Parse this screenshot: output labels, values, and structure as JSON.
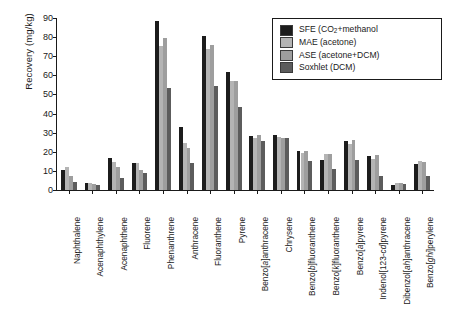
{
  "chart_data": {
    "type": "bar",
    "title": "",
    "xlabel": "",
    "ylabel": "Recovery (mg/kg)",
    "ylim": [
      0,
      90
    ],
    "yticks": [
      0,
      10,
      20,
      30,
      40,
      50,
      60,
      70,
      80,
      90
    ],
    "grid": false,
    "legend_position": "top-right",
    "categories": [
      "Naphthalene",
      "Acenaphthylene",
      "Acenaphthene",
      "Fluorene",
      "Phenanthrene",
      "Anthracene",
      "Fluoranthene",
      "Pyrene",
      "Benzo[a]anthracene",
      "Chrysene",
      "Benzo[b]fluoranthene",
      "Benzo[k]fluoranthene",
      "Benzo[a]pyrene",
      "Indenol[123-cd]pyrene",
      "Dibenzol[ah]anthracene",
      "Benzo[ghi]perylene"
    ],
    "categories_html": [
      "Naphthalene",
      "Acenaphthylene",
      "Acenaphthene",
      "Fluorene",
      "Phenanthrene",
      "Anthracene",
      "Fluoranthene",
      "Pyrene",
      "Benzo[<i>a</i>]anthracene",
      "Chrysene",
      "Benzo[<i>b</i>]fluoranthene",
      "Benzo[<i>k</i>]fluoranthene",
      "Benzo[<i>a</i>]pyrene",
      "Indenol[123-<i>cd</i>]pyrene",
      "Dibenzol[<i>ah</i>]anthracene",
      "Benzo[<i>ghi</i>]perylene"
    ],
    "series": [
      {
        "name": "SFE (CO2+methanol",
        "name_html": "SFE (CO<sub>2</sub>+methanol",
        "color": "#1c1c1c",
        "values": [
          10.5,
          3.5,
          16.5,
          14.2,
          88.5,
          33.0,
          80.5,
          62.0,
          28.2,
          29.0,
          20.3,
          15.5,
          25.4,
          17.7,
          2.6,
          13.4
        ]
      },
      {
        "name": "MAE (acetone)",
        "name_html": "MAE (acetone)",
        "color": "#b4b4b4",
        "values": [
          12.0,
          3.6,
          14.6,
          14.0,
          75.2,
          24.6,
          74.0,
          57.0,
          27.0,
          27.8,
          19.6,
          18.6,
          24.3,
          16.0,
          3.8,
          15.0
        ]
      },
      {
        "name": "ASE (acetone+DCM)",
        "name_html": "ASE (acetone+DCM)",
        "color": "#9e9e9e",
        "values": [
          7.2,
          3.1,
          12.0,
          10.6,
          79.8,
          22.2,
          76.0,
          57.2,
          28.8,
          27.4,
          20.3,
          19.0,
          26.2,
          18.5,
          3.9,
          14.6
        ]
      },
      {
        "name": "Soxhlet (DCM)",
        "name_html": "Soxhlet (DCM)",
        "color": "#5c5c5c",
        "values": [
          4.1,
          2.5,
          6.5,
          9.0,
          53.5,
          14.0,
          54.2,
          43.5,
          25.8,
          27.1,
          15.4,
          11.2,
          15.5,
          7.4,
          3.4,
          7.5
        ]
      }
    ]
  }
}
